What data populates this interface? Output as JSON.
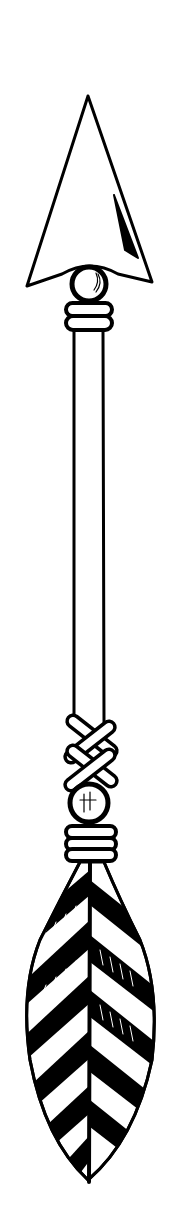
{
  "image": {
    "subject": "arrow illustration",
    "style": "black ink line drawing on white",
    "parts": [
      "arrowhead",
      "bead",
      "bindings",
      "shaft",
      "cross-lashing",
      "feather-fletching"
    ]
  },
  "colors": {
    "ink": "#000000",
    "paper": "#ffffff"
  }
}
